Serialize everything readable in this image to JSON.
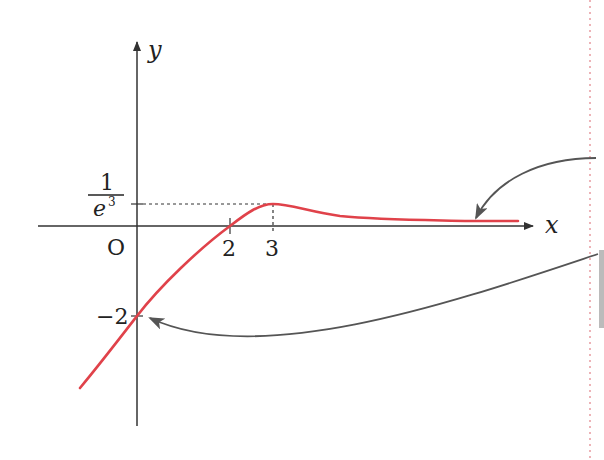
{
  "figure": {
    "type": "function-graph",
    "axes": {
      "x_label": "x",
      "y_label": "y",
      "origin_label": "O"
    },
    "ticks": {
      "x": [
        {
          "value": 2,
          "label": "2"
        },
        {
          "value": 3,
          "label": "3"
        }
      ],
      "y": [
        {
          "value": -2,
          "label": "−2"
        },
        {
          "value": 0.0498,
          "label_numerator": "1",
          "label_denominator_base": "e",
          "label_denominator_exp": "3"
        }
      ]
    },
    "curve": {
      "color": "#e0424a",
      "key_points": [
        {
          "x": 0,
          "y": -2,
          "note": "y-intercept"
        },
        {
          "x": 2,
          "y": 0,
          "note": "x-intercept"
        },
        {
          "x": 3,
          "y": "1/e^3",
          "note": "local maximum"
        }
      ],
      "asymptote": "y = 0 as x → ∞"
    },
    "annotations": [
      {
        "type": "arrow",
        "target": "curve tail approaching x-axis",
        "color": "#555555"
      },
      {
        "type": "arrow",
        "target": "y-intercept (0, −2)",
        "color": "#555555"
      }
    ],
    "page_margin_line_color": "#e79aa0"
  }
}
